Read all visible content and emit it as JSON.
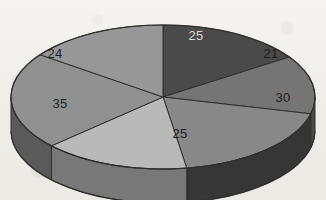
{
  "figure": {
    "background_color": "#f2f0ec",
    "outline_color": "#2f2f2f"
  },
  "chart_data": {
    "type": "pie",
    "title": "",
    "subtitle": "",
    "xlabel": "",
    "ylabel": "",
    "legend": "none",
    "grid": false,
    "three_d": true,
    "total": 160,
    "categories": [
      "25",
      "21",
      "30",
      "25",
      "35",
      "24"
    ],
    "values": [
      25,
      21,
      30,
      25,
      35,
      24
    ],
    "slices": [
      {
        "label": "25",
        "value": 25,
        "percent": 15.6,
        "top_color": "#4a4a4a",
        "side_color": "#343434",
        "label_color": "#d8d8d8",
        "label_x": 196,
        "label_y": 40
      },
      {
        "label": "21",
        "value": 21,
        "percent": 13.1,
        "top_color": "#757575",
        "side_color": "#4a4a4a",
        "label_color": "#1e1e1e",
        "label_x": 271,
        "label_y": 58
      },
      {
        "label": "30",
        "value": 30,
        "percent": 18.8,
        "top_color": "#888888",
        "side_color": "#363636",
        "label_color": "#1e1e1e",
        "label_x": 283,
        "label_y": 102
      },
      {
        "label": "25",
        "value": 25,
        "percent": 15.6,
        "top_color": "#b9b9b9",
        "side_color": "#787878",
        "label_color": "#1e1e1e",
        "label_x": 180,
        "label_y": 138
      },
      {
        "label": "35",
        "value": 35,
        "percent": 21.9,
        "top_color": "#909090",
        "side_color": "#5a5a5a",
        "label_color": "#1e1e1e",
        "label_x": 60,
        "label_y": 108
      },
      {
        "label": "24",
        "value": 24,
        "percent": 15.0,
        "top_color": "#979797",
        "side_color": "#5e5e5e",
        "label_color": "#1e1e1e",
        "label_x": 55,
        "label_y": 58
      }
    ]
  }
}
